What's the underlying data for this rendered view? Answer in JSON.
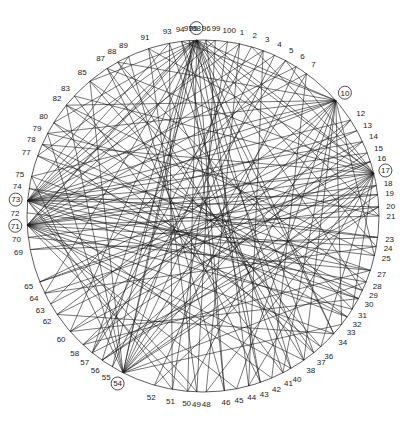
{
  "diagram": {
    "type": "circular-network-graph",
    "center": [
      203,
      216
    ],
    "radius": 176,
    "label_radius": 188,
    "colors": {
      "line": "#1a1a1a",
      "label": "#222222",
      "background": "#ffffff"
    },
    "hubs": [
      "98",
      "10",
      "17",
      "73",
      "71",
      "54"
    ],
    "nodes": [
      {
        "id": "98",
        "angle": -92
      },
      {
        "id": "99",
        "angle": -86
      },
      {
        "id": "100",
        "angle": -82
      },
      {
        "id": "1",
        "angle": -78
      },
      {
        "id": "2",
        "angle": -74
      },
      {
        "id": "3",
        "angle": -70
      },
      {
        "id": "4",
        "angle": -66
      },
      {
        "id": "5",
        "angle": -62
      },
      {
        "id": "6",
        "angle": -58
      },
      {
        "id": "7",
        "angle": -54
      },
      {
        "id": "10",
        "angle": -41
      },
      {
        "id": "12",
        "angle": -33
      },
      {
        "id": "13",
        "angle": -29
      },
      {
        "id": "14",
        "angle": -25
      },
      {
        "id": "15",
        "angle": -21
      },
      {
        "id": "16",
        "angle": -18
      },
      {
        "id": "17",
        "angle": -14
      },
      {
        "id": "18",
        "angle": -10
      },
      {
        "id": "19",
        "angle": -7
      },
      {
        "id": "20",
        "angle": -3
      },
      {
        "id": "21",
        "angle": 0
      },
      {
        "id": "23",
        "angle": 7
      },
      {
        "id": "24",
        "angle": 10
      },
      {
        "id": "25",
        "angle": 13
      },
      {
        "id": "27",
        "angle": 18
      },
      {
        "id": "28",
        "angle": 22
      },
      {
        "id": "29",
        "angle": 25
      },
      {
        "id": "30",
        "angle": 28
      },
      {
        "id": "31",
        "angle": 32
      },
      {
        "id": "32",
        "angle": 35
      },
      {
        "id": "33",
        "angle": 38
      },
      {
        "id": "34",
        "angle": 42
      },
      {
        "id": "36",
        "angle": 48
      },
      {
        "id": "37",
        "angle": 51
      },
      {
        "id": "38",
        "angle": 55
      },
      {
        "id": "40",
        "angle": 60
      },
      {
        "id": "41",
        "angle": 63
      },
      {
        "id": "42",
        "angle": 67
      },
      {
        "id": "43",
        "angle": 71
      },
      {
        "id": "44",
        "angle": 75
      },
      {
        "id": "45",
        "angle": 79
      },
      {
        "id": "46",
        "angle": 83
      },
      {
        "id": "48",
        "angle": 89
      },
      {
        "id": "49",
        "angle": 92
      },
      {
        "id": "50",
        "angle": 95
      },
      {
        "id": "51",
        "angle": 100
      },
      {
        "id": "52",
        "angle": 106
      },
      {
        "id": "54",
        "angle": 117
      },
      {
        "id": "55",
        "angle": 121
      },
      {
        "id": "56",
        "angle": 125
      },
      {
        "id": "57",
        "angle": 129
      },
      {
        "id": "58",
        "angle": 133
      },
      {
        "id": "60",
        "angle": 139
      },
      {
        "id": "62",
        "angle": 146
      },
      {
        "id": "63",
        "angle": 150
      },
      {
        "id": "64",
        "angle": 154
      },
      {
        "id": "65",
        "angle": 158
      },
      {
        "id": "69",
        "angle": 169
      },
      {
        "id": "70",
        "angle": 173
      },
      {
        "id": "71",
        "angle": 177
      },
      {
        "id": "72",
        "angle": 181
      },
      {
        "id": "73",
        "angle": 185
      },
      {
        "id": "74",
        "angle": 189
      },
      {
        "id": "75",
        "angle": 193
      },
      {
        "id": "77",
        "angle": 200
      },
      {
        "id": "78",
        "angle": 204
      },
      {
        "id": "79",
        "angle": 208
      },
      {
        "id": "80",
        "angle": 212
      },
      {
        "id": "82",
        "angle": 219
      },
      {
        "id": "83",
        "angle": 223
      },
      {
        "id": "85",
        "angle": 230
      },
      {
        "id": "87",
        "angle": 237
      },
      {
        "id": "88",
        "angle": 241
      },
      {
        "id": "89",
        "angle": 245
      },
      {
        "id": "91",
        "angle": 252
      },
      {
        "id": "93",
        "angle": 259
      },
      {
        "id": "94",
        "angle": 263
      },
      {
        "id": "95",
        "angle": 267
      },
      {
        "id": "96",
        "angle": 271
      },
      {
        "id": "97",
        "angle": 265.5
      }
    ],
    "edges": [
      [
        "98",
        "10"
      ],
      [
        "98",
        "17"
      ],
      [
        "98",
        "73"
      ],
      [
        "98",
        "71"
      ],
      [
        "98",
        "54"
      ],
      [
        "98",
        "34"
      ],
      [
        "98",
        "40"
      ],
      [
        "98",
        "46"
      ],
      [
        "98",
        "60"
      ],
      [
        "98",
        "80"
      ],
      [
        "98",
        "85"
      ],
      [
        "98",
        "24"
      ],
      [
        "98",
        "29"
      ],
      [
        "98",
        "50"
      ],
      [
        "98",
        "64"
      ],
      [
        "98",
        "21"
      ],
      [
        "98",
        "37"
      ],
      [
        "98",
        "43"
      ],
      [
        "98",
        "57"
      ],
      [
        "98",
        "77"
      ],
      [
        "10",
        "73"
      ],
      [
        "10",
        "71"
      ],
      [
        "10",
        "54"
      ],
      [
        "10",
        "62"
      ],
      [
        "10",
        "50"
      ],
      [
        "10",
        "45"
      ],
      [
        "10",
        "41"
      ],
      [
        "10",
        "82"
      ],
      [
        "10",
        "88"
      ],
      [
        "10",
        "75"
      ],
      [
        "10",
        "58"
      ],
      [
        "10",
        "38"
      ],
      [
        "10",
        "33"
      ],
      [
        "10",
        "25"
      ],
      [
        "10",
        "79"
      ],
      [
        "10",
        "94"
      ],
      [
        "17",
        "73"
      ],
      [
        "17",
        "71"
      ],
      [
        "17",
        "54"
      ],
      [
        "17",
        "91"
      ],
      [
        "17",
        "87"
      ],
      [
        "17",
        "83"
      ],
      [
        "17",
        "78"
      ],
      [
        "17",
        "65"
      ],
      [
        "17",
        "56"
      ],
      [
        "17",
        "52"
      ],
      [
        "17",
        "48"
      ],
      [
        "17",
        "44"
      ],
      [
        "17",
        "36"
      ],
      [
        "17",
        "31"
      ],
      [
        "17",
        "96"
      ],
      [
        "17",
        "2"
      ],
      [
        "17",
        "5"
      ],
      [
        "17",
        "60"
      ],
      [
        "73",
        "12"
      ],
      [
        "73",
        "14"
      ],
      [
        "73",
        "19"
      ],
      [
        "73",
        "23"
      ],
      [
        "73",
        "27"
      ],
      [
        "73",
        "30"
      ],
      [
        "73",
        "32"
      ],
      [
        "73",
        "42"
      ],
      [
        "73",
        "49"
      ],
      [
        "73",
        "51"
      ],
      [
        "73",
        "3"
      ],
      [
        "73",
        "6"
      ],
      [
        "73",
        "1"
      ],
      [
        "73",
        "99"
      ],
      [
        "73",
        "93"
      ],
      [
        "73",
        "89"
      ],
      [
        "73",
        "15"
      ],
      [
        "73",
        "20"
      ],
      [
        "71",
        "13"
      ],
      [
        "71",
        "16"
      ],
      [
        "71",
        "18"
      ],
      [
        "71",
        "24"
      ],
      [
        "71",
        "28"
      ],
      [
        "71",
        "34"
      ],
      [
        "71",
        "40"
      ],
      [
        "71",
        "45"
      ],
      [
        "71",
        "50"
      ],
      [
        "71",
        "4"
      ],
      [
        "71",
        "7"
      ],
      [
        "71",
        "100"
      ],
      [
        "71",
        "95"
      ],
      [
        "71",
        "38"
      ],
      [
        "71",
        "21"
      ],
      [
        "71",
        "31"
      ],
      [
        "54",
        "4"
      ],
      [
        "54",
        "7"
      ],
      [
        "54",
        "12"
      ],
      [
        "54",
        "20"
      ],
      [
        "54",
        "28"
      ],
      [
        "54",
        "85"
      ],
      [
        "54",
        "79"
      ],
      [
        "54",
        "95"
      ],
      [
        "54",
        "1"
      ],
      [
        "54",
        "19"
      ],
      [
        "54",
        "33"
      ],
      [
        "54",
        "75"
      ],
      [
        "54",
        "82"
      ],
      [
        "1",
        "48"
      ],
      [
        "2",
        "57"
      ],
      [
        "3",
        "44"
      ],
      [
        "5",
        "63"
      ],
      [
        "6",
        "52"
      ],
      [
        "7",
        "42"
      ],
      [
        "12",
        "60"
      ],
      [
        "13",
        "65"
      ],
      [
        "14",
        "56"
      ],
      [
        "15",
        "58"
      ],
      [
        "16",
        "62"
      ],
      [
        "18",
        "64"
      ],
      [
        "19",
        "70"
      ],
      [
        "20",
        "69"
      ],
      [
        "23",
        "74"
      ],
      [
        "25",
        "72"
      ],
      [
        "27",
        "77"
      ],
      [
        "29",
        "78"
      ],
      [
        "30",
        "80"
      ],
      [
        "32",
        "82"
      ],
      [
        "36",
        "85"
      ],
      [
        "37",
        "87"
      ],
      [
        "38",
        "88"
      ],
      [
        "40",
        "91"
      ],
      [
        "41",
        "93"
      ],
      [
        "43",
        "94"
      ],
      [
        "44",
        "96"
      ],
      [
        "46",
        "97"
      ],
      [
        "49",
        "99"
      ],
      [
        "51",
        "100"
      ],
      [
        "55",
        "3"
      ],
      [
        "57",
        "5"
      ],
      [
        "63",
        "14"
      ],
      [
        "65",
        "16"
      ],
      [
        "69",
        "23"
      ],
      [
        "70",
        "27"
      ],
      [
        "74",
        "29"
      ],
      [
        "75",
        "30"
      ],
      [
        "77",
        "32"
      ],
      [
        "78",
        "36"
      ],
      [
        "80",
        "37"
      ],
      [
        "83",
        "41"
      ],
      [
        "87",
        "43"
      ],
      [
        "89",
        "46"
      ],
      [
        "91",
        "49"
      ],
      [
        "93",
        "51"
      ],
      [
        "95",
        "55"
      ],
      [
        "96",
        "56"
      ],
      [
        "82",
        "25"
      ],
      [
        "79",
        "21"
      ],
      [
        "85",
        "28"
      ],
      [
        "88",
        "31"
      ],
      [
        "97",
        "34"
      ],
      [
        "94",
        "38"
      ],
      [
        "60",
        "30"
      ],
      [
        "62",
        "34"
      ],
      [
        "58",
        "27"
      ],
      [
        "64",
        "24"
      ],
      [
        "57",
        "20"
      ],
      [
        "56",
        "18"
      ]
    ]
  }
}
